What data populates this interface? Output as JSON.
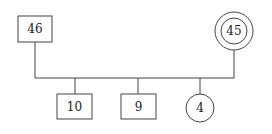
{
  "diagram": {
    "type": "genogram",
    "parents": [
      {
        "id": "father",
        "label": "46",
        "shape": "square"
      },
      {
        "id": "mother",
        "label": "45",
        "shape": "double-circle"
      }
    ],
    "children": [
      {
        "id": "child1",
        "label": "10",
        "shape": "square"
      },
      {
        "id": "child2",
        "label": "9",
        "shape": "square"
      },
      {
        "id": "child3",
        "label": "4",
        "shape": "circle"
      }
    ],
    "colors": {
      "stroke": "#444444",
      "fill": "#ffffff",
      "text": "#222222"
    }
  }
}
